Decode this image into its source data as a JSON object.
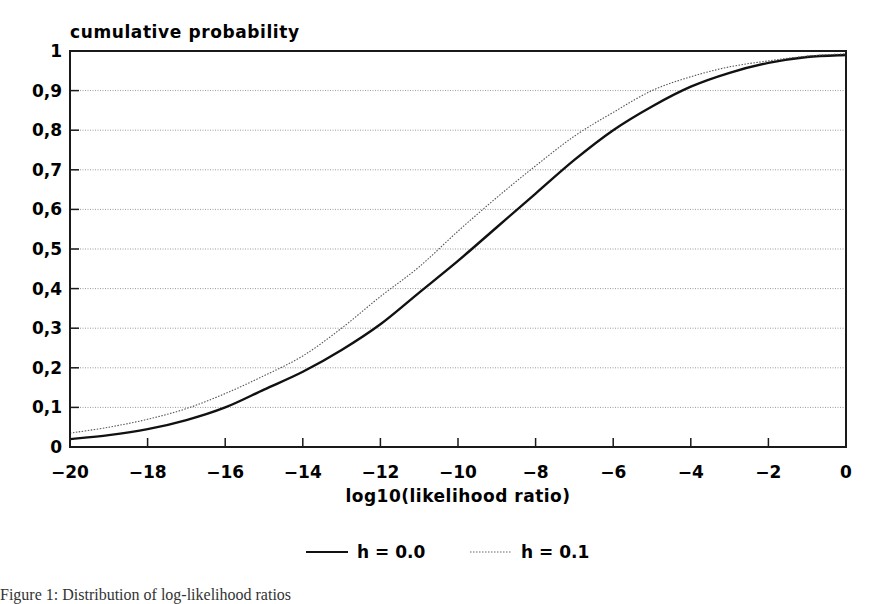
{
  "chart_data": {
    "type": "line",
    "title": "",
    "xlabel": "log10(likelihood ratio)",
    "ylabel": "cumulative probability",
    "xlim": [
      -20,
      0
    ],
    "ylim": [
      0,
      1
    ],
    "x_ticks": [
      "-20",
      "-18",
      "-16",
      "-14",
      "-12",
      "-10",
      "-8",
      "-6",
      "-4",
      "-2",
      "0"
    ],
    "y_ticks": [
      "0",
      "0,1",
      "0,2",
      "0,3",
      "0,4",
      "0,5",
      "0,6",
      "0,7",
      "0,8",
      "0,9",
      "1"
    ],
    "grid": "horizontal dotted",
    "legend_position": "bottom center",
    "series": [
      {
        "name": "h = 0.0",
        "style": "solid",
        "x": [
          -20,
          -19,
          -18,
          -17,
          -16,
          -15,
          -14,
          -13,
          -12,
          -11,
          -10,
          -9,
          -8,
          -7,
          -6,
          -5,
          -4,
          -3,
          -2,
          -1,
          0
        ],
        "values": [
          0.02,
          0.03,
          0.045,
          0.068,
          0.1,
          0.145,
          0.19,
          0.245,
          0.31,
          0.39,
          0.47,
          0.555,
          0.64,
          0.725,
          0.8,
          0.86,
          0.91,
          0.945,
          0.97,
          0.985,
          0.99
        ]
      },
      {
        "name": "h = 0.1",
        "style": "dotted",
        "x": [
          -20,
          -19,
          -18,
          -17,
          -16,
          -15,
          -14,
          -13,
          -12,
          -11,
          -10,
          -9,
          -8,
          -7,
          -6,
          -5,
          -4,
          -3,
          -2,
          -1,
          0
        ],
        "values": [
          0.035,
          0.05,
          0.07,
          0.097,
          0.135,
          0.18,
          0.23,
          0.3,
          0.38,
          0.455,
          0.545,
          0.63,
          0.71,
          0.785,
          0.845,
          0.9,
          0.935,
          0.96,
          0.975,
          0.987,
          0.993
        ]
      }
    ]
  },
  "legend": {
    "items": [
      {
        "label": "h = 0.0",
        "style": "solid"
      },
      {
        "label": "h = 0.1",
        "style": "dotted"
      }
    ]
  },
  "caption": "Figure 1: Distribution of log-likelihood ratios",
  "colors": {
    "axis": "#1a1a1a",
    "grid": "#9a9a9a",
    "series_solid": "#111111",
    "series_dotted": "#555555"
  }
}
